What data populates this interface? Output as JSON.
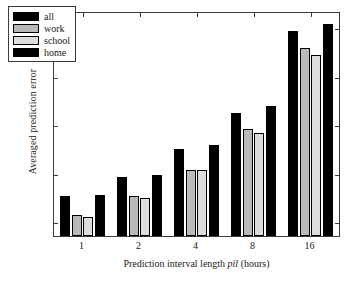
{
  "chart_data": {
    "type": "bar",
    "title": "",
    "xlabel": "Prediction interval length pil (hours)",
    "xlabel_prefix": "Prediction interval length ",
    "xlabel_italic": "pil",
    "xlabel_suffix": " (hours)",
    "ylabel": "Averaged prediction error",
    "categories": [
      "1",
      "2",
      "4",
      "8",
      "16"
    ],
    "xlim": [
      0,
      5
    ],
    "ylim": [
      0.037,
      0.2665
    ],
    "yticks": [
      0.05,
      0.1,
      0.15,
      0.2,
      0.25
    ],
    "ytick_labels": [
      "0.05",
      "0.1",
      "0.15",
      "0.2",
      "0.25"
    ],
    "grid": false,
    "legend_position": "upper-left",
    "series": [
      {
        "name": "all",
        "color": "#000000",
        "values": [
          0.078,
          0.098,
          0.127,
          0.164,
          0.248
        ]
      },
      {
        "name": "work",
        "color": "#b9b9b9",
        "values": [
          0.059,
          0.078,
          0.105,
          0.147,
          0.23
        ]
      },
      {
        "name": "school",
        "color": "#dcdcdc",
        "values": [
          0.057,
          0.076,
          0.105,
          0.143,
          0.223
        ]
      },
      {
        "name": "home",
        "color": "#000000",
        "values": [
          0.079,
          0.1,
          0.131,
          0.171,
          0.255
        ]
      }
    ]
  },
  "legend": {
    "items": [
      {
        "label": "all",
        "color": "#000000"
      },
      {
        "label": "work",
        "color": "#b9b9b9"
      },
      {
        "label": "school",
        "color": "#dcdcdc"
      },
      {
        "label": "home",
        "color": "#000000"
      }
    ]
  },
  "axes": {
    "frame_color": "#3a3a3a",
    "background": "#ffffff"
  }
}
